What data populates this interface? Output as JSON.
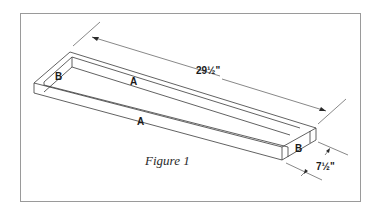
{
  "figure": {
    "caption": "Figure 1",
    "frame_color": "#9a9a9a",
    "line_color": "#3a3a3a"
  },
  "parts": {
    "side_label_back": "A",
    "side_label_front": "A",
    "end_label_left": "B",
    "end_label_right": "B"
  },
  "dimensions": {
    "length": "29½\"",
    "width": "7½\""
  }
}
